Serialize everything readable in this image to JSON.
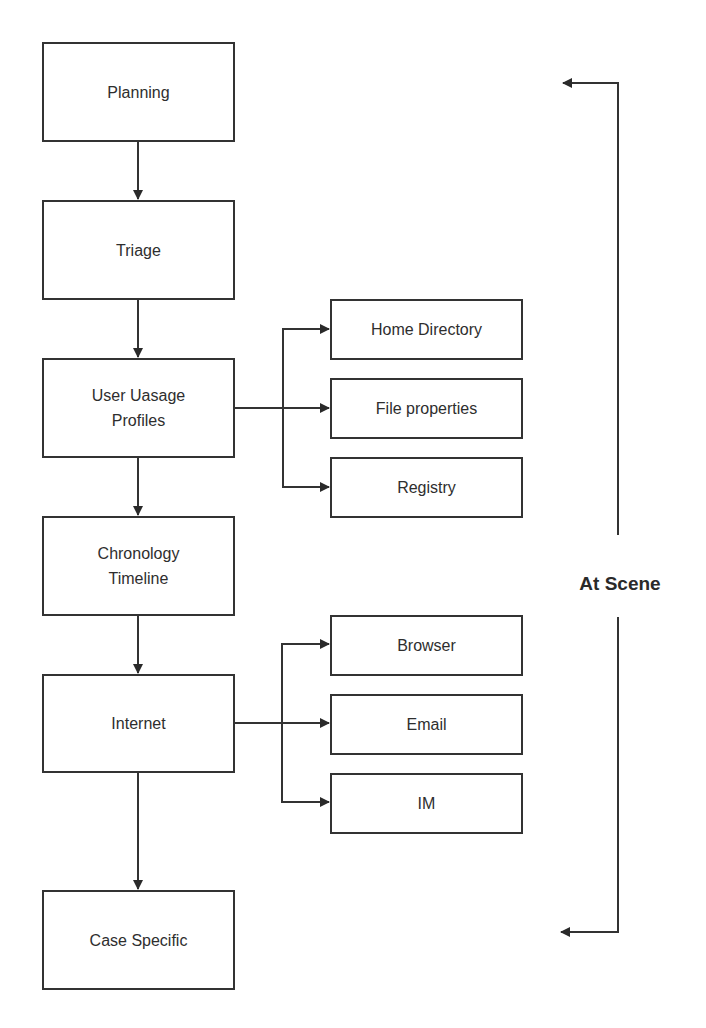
{
  "diagram": {
    "type": "flowchart",
    "main_steps": [
      {
        "id": "planning",
        "label": "Planning"
      },
      {
        "id": "triage",
        "label": "Triage"
      },
      {
        "id": "user-usage-profiles",
        "label": "User Uasage\nProfiles",
        "line1": "User Uasage",
        "line2": "Profiles"
      },
      {
        "id": "chronology-timeline",
        "label": "Chronology\nTimeline",
        "line1": "Chronology",
        "line2": "Timeline"
      },
      {
        "id": "internet",
        "label": "Internet"
      },
      {
        "id": "case-specific",
        "label": "Case Specific"
      }
    ],
    "user_usage_branches": [
      {
        "id": "home-directory",
        "label": "Home Directory"
      },
      {
        "id": "file-properties",
        "label": "File properties"
      },
      {
        "id": "registry",
        "label": "Registry"
      }
    ],
    "internet_branches": [
      {
        "id": "browser",
        "label": "Browser"
      },
      {
        "id": "email",
        "label": "Email"
      },
      {
        "id": "im",
        "label": "IM"
      }
    ],
    "scope_bracket": {
      "label": "At Scene",
      "from": "planning",
      "to": "case-specific"
    },
    "edges": [
      [
        "planning",
        "triage"
      ],
      [
        "triage",
        "user-usage-profiles"
      ],
      [
        "user-usage-profiles",
        "chronology-timeline"
      ],
      [
        "chronology-timeline",
        "internet"
      ],
      [
        "internet",
        "case-specific"
      ],
      [
        "user-usage-profiles",
        "home-directory"
      ],
      [
        "user-usage-profiles",
        "file-properties"
      ],
      [
        "user-usage-profiles",
        "registry"
      ],
      [
        "internet",
        "browser"
      ],
      [
        "internet",
        "email"
      ],
      [
        "internet",
        "im"
      ]
    ],
    "colors": {
      "stroke": "#333333",
      "text": "#2e2e2e",
      "background": "#ffffff"
    }
  }
}
